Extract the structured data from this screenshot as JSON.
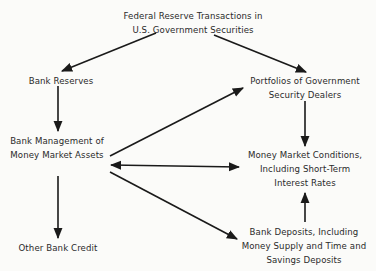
{
  "diagram": {
    "type": "flowchart",
    "nodes": {
      "fed_transactions": {
        "lines": [
          "Federal Reserve Transactions in",
          "U.S. Government Securities"
        ]
      },
      "bank_reserves": {
        "lines": [
          "Bank Reserves"
        ]
      },
      "dealer_portfolios": {
        "lines": [
          "Portfolios of Government",
          "Security Dealers"
        ]
      },
      "bank_management": {
        "lines": [
          "Bank Management of",
          "Money Market Assets"
        ]
      },
      "money_market_conditions": {
        "lines": [
          "Money Market Conditions,",
          "Including Short-Term",
          "Interest Rates"
        ]
      },
      "other_bank_credit": {
        "lines": [
          "Other Bank Credit"
        ]
      },
      "bank_deposits": {
        "lines": [
          "Bank Deposits, Including",
          "Money Supply and Time and",
          "Savings Deposits"
        ]
      }
    },
    "edges": [
      {
        "from": "fed_transactions",
        "to": "bank_reserves",
        "direction": "forward"
      },
      {
        "from": "fed_transactions",
        "to": "dealer_portfolios",
        "direction": "forward"
      },
      {
        "from": "bank_reserves",
        "to": "bank_management",
        "direction": "forward"
      },
      {
        "from": "bank_management",
        "to": "dealer_portfolios",
        "direction": "forward"
      },
      {
        "from": "bank_management",
        "to": "money_market_conditions",
        "direction": "both"
      },
      {
        "from": "bank_management",
        "to": "bank_deposits",
        "direction": "forward"
      },
      {
        "from": "bank_management",
        "to": "other_bank_credit",
        "direction": "forward"
      },
      {
        "from": "dealer_portfolios",
        "to": "money_market_conditions",
        "direction": "forward"
      },
      {
        "from": "bank_deposits",
        "to": "money_market_conditions",
        "direction": "forward"
      }
    ],
    "colors": {
      "line": "#1a1a1a",
      "text": "#2a2a2a",
      "background": "#fbfbf9"
    }
  }
}
